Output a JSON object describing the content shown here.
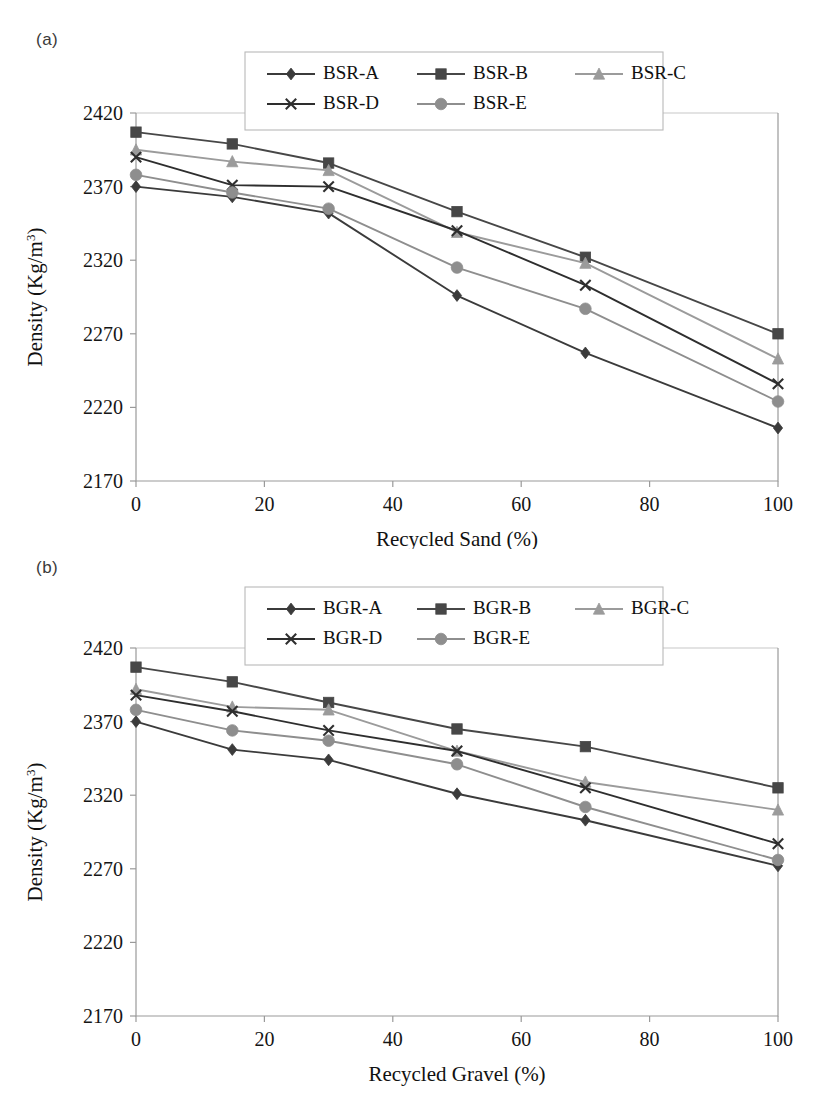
{
  "figure": {
    "panels": [
      {
        "id": "a",
        "label": "(a)",
        "xlabel": "Recycled Sand (%)",
        "ylabel_main": "Density (Kg/m",
        "ylabel_sup": "3",
        "ylabel_tail": ")"
      },
      {
        "id": "b",
        "label": "(b)",
        "xlabel": "Recycled Gravel (%)",
        "ylabel_main": "Density (Kg/m",
        "ylabel_sup": "3",
        "ylabel_tail": ")"
      }
    ],
    "yticks": [
      "2170",
      "2220",
      "2270",
      "2320",
      "2370",
      "2420"
    ],
    "xticks": [
      "0",
      "20",
      "40",
      "60",
      "80",
      "100"
    ]
  },
  "colors": {
    "series_a": "#3b3b3b",
    "series_b": "#474747",
    "series_c": "#9b9b9b",
    "series_d": "#2e2e2e",
    "series_e": "#8e8e8e",
    "axis": "#9a9a9a",
    "text": "#111111",
    "legend_border": "#b9b9b9"
  },
  "chart_data": [
    {
      "type": "line",
      "title": "(a)",
      "xlabel": "Recycled Sand (%)",
      "ylabel": "Density (Kg/m3)",
      "xlim": [
        0,
        100
      ],
      "ylim": [
        2170,
        2420
      ],
      "ytick_step": 50,
      "grid": false,
      "legend_position": "top-center",
      "x": [
        0,
        15,
        30,
        50,
        70,
        100
      ],
      "series": [
        {
          "name": "BSR-A",
          "marker": "diamond",
          "color": "#3b3b3b",
          "values": [
            2370,
            2363,
            2352,
            2296,
            2257,
            2206
          ]
        },
        {
          "name": "BSR-B",
          "marker": "square",
          "color": "#474747",
          "values": [
            2407,
            2399,
            2386,
            2353,
            2322,
            2270
          ]
        },
        {
          "name": "BSR-C",
          "marker": "triangle",
          "color": "#9b9b9b",
          "values": [
            2395,
            2387,
            2381,
            2339,
            2318,
            2253
          ]
        },
        {
          "name": "BSR-D",
          "marker": "cross",
          "color": "#2e2e2e",
          "values": [
            2390,
            2371,
            2370,
            2340,
            2303,
            2236
          ]
        },
        {
          "name": "BSR-E",
          "marker": "circle",
          "color": "#8e8e8e",
          "values": [
            2378,
            2366,
            2355,
            2315,
            2287,
            2224
          ]
        }
      ]
    },
    {
      "type": "line",
      "title": "(b)",
      "xlabel": "Recycled Gravel (%)",
      "ylabel": "Density (Kg/m3)",
      "xlim": [
        0,
        100
      ],
      "ylim": [
        2170,
        2420
      ],
      "ytick_step": 50,
      "grid": false,
      "legend_position": "top-center",
      "x": [
        0,
        15,
        30,
        50,
        70,
        100
      ],
      "series": [
        {
          "name": "BGR-A",
          "marker": "diamond",
          "color": "#3b3b3b",
          "values": [
            2370,
            2351,
            2344,
            2321,
            2303,
            2272
          ]
        },
        {
          "name": "BGR-B",
          "marker": "square",
          "color": "#474747",
          "values": [
            2407,
            2397,
            2383,
            2365,
            2353,
            2325
          ]
        },
        {
          "name": "BGR-C",
          "marker": "triangle",
          "color": "#9b9b9b",
          "values": [
            2392,
            2380,
            2378,
            2350,
            2329,
            2310
          ]
        },
        {
          "name": "BGR-D",
          "marker": "cross",
          "color": "#2e2e2e",
          "values": [
            2388,
            2377,
            2364,
            2350,
            2325,
            2287
          ]
        },
        {
          "name": "BGR-E",
          "marker": "circle",
          "color": "#8e8e8e",
          "values": [
            2378,
            2364,
            2357,
            2341,
            2312,
            2276
          ]
        }
      ]
    }
  ],
  "legends": [
    {
      "panel": "a",
      "entries": [
        "BSR-A",
        "BSR-B",
        "BSR-C",
        "BSR-D",
        "BSR-E"
      ]
    },
    {
      "panel": "b",
      "entries": [
        "BGR-A",
        "BGR-B",
        "BGR-C",
        "BGR-D",
        "BGR-E"
      ]
    }
  ]
}
